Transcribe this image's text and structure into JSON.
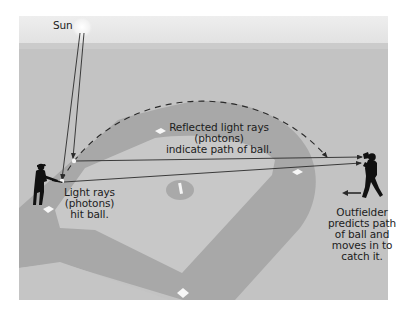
{
  "figure": {
    "colors": {
      "sky": "#e8e8e8",
      "field": "#c3c3c3",
      "infield_grass": "#c9c9c9",
      "dirt": "#a7a7a7",
      "mound": "#a9a9a9",
      "base": "#f7f7f7",
      "ray": "#2a2a2a",
      "figure": "#111111",
      "sun": "#f0f0f0"
    },
    "labels": {
      "sun": "Sun",
      "reflected": [
        "Reflected light rays",
        "(photons)",
        "indicate path of ball."
      ],
      "light": [
        "Light rays",
        "(photons)",
        "hit ball."
      ],
      "outfielder": [
        "Outfielder",
        "predicts path",
        "of ball and",
        "moves in to",
        "catch it."
      ]
    },
    "icons": {
      "sun": "sun-icon",
      "batter": "batter-icon",
      "outfielder": "outfielder-icon",
      "ball": "ball-icon",
      "move_arrow": "arrow-left-icon"
    }
  }
}
